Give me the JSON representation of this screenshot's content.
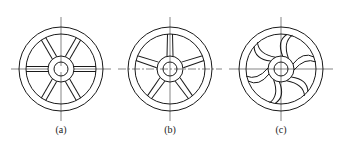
{
  "figure": {
    "panels": [
      {
        "label": "(a)",
        "spoke_type": "straight",
        "spoke_count": 6,
        "center": [
          61,
          69
        ]
      },
      {
        "label": "(b)",
        "spoke_type": "straight-tapered",
        "spoke_count": 5,
        "center": [
          170,
          69
        ]
      },
      {
        "label": "(c)",
        "spoke_type": "curved",
        "spoke_count": 6,
        "center": [
          281,
          69
        ]
      }
    ],
    "line_color": "#1a1a1a",
    "background": "#ffffff"
  }
}
